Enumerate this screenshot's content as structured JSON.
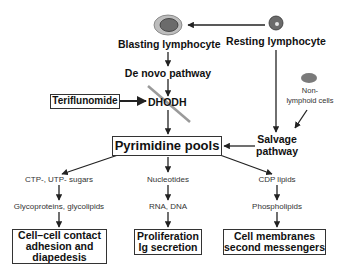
{
  "nodes": {
    "blasting": "Blasting lymphocyte",
    "resting": "Resting lymphocyte",
    "de_novo": "De novo pathway",
    "teriflunomide": "Teriflunomide",
    "dhodh": "DHODH",
    "non_lymphoid_1": "Non-",
    "non_lymphoid_2": "lymphoid cells",
    "pyrimidine": "Pyrimidine pools",
    "salvage_1": "Salvage",
    "salvage_2": "pathway"
  },
  "branches": [
    {
      "step1": "CTP-, UTP- sugars",
      "step2": "Glycoproteins, glycolipids",
      "outcome": [
        "Cell–cell contact",
        "adhesion and",
        "diapedesis"
      ]
    },
    {
      "step1": "Nucleotides",
      "step2": "RNA, DNA",
      "outcome": [
        "Proliferation",
        "Ig secretion"
      ]
    },
    {
      "step1": "CDP lipids",
      "step2": "Phospholipids",
      "outcome": [
        "Cell membranes",
        "second messengers"
      ]
    }
  ],
  "icons": {
    "blasting_cell": "blasting-lymphocyte-icon",
    "resting_cell": "resting-lymphocyte-icon",
    "non_lymphoid_cell": "non-lymphoid-cell-icon",
    "inhibition_slash": "inhibition-slash-icon"
  },
  "colors": {
    "line": "#222222",
    "cell_outer": "#bdbdbd",
    "cell_inner": "#666666",
    "slash": "#9a9a9a"
  }
}
